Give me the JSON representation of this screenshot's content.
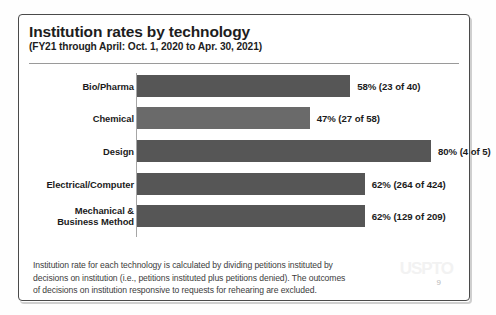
{
  "slide": {
    "title": "Institution rates by technology",
    "subtitle": "(FY21 through April: Oct. 1, 2020 to Apr. 30, 2021)",
    "page_number": "9",
    "watermark": "USPTO"
  },
  "footnote": {
    "line1": "Institution rate for each technology is calculated by dividing petitions instituted by",
    "line2": "decisions on institution (i.e., petitions instituted plus petitions denied). The outcomes",
    "line3": "of decisions on institution responsive to requests for rehearing are excluded."
  },
  "colors": {
    "bar_dark": "#565656",
    "bar_light": "#6a6a6a",
    "text": "#1b1b1b",
    "frame": "#4a4a4a"
  },
  "chart_data": {
    "type": "bar",
    "orientation": "horizontal",
    "title": "Institution rates by technology",
    "subtitle": "(FY21 through April: Oct. 1, 2020 to Apr. 30, 2021)",
    "xlabel": "",
    "ylabel": "",
    "xlim": [
      0,
      80
    ],
    "grid": false,
    "legend": "none",
    "categories": [
      "Bio/Pharma",
      "Chemical",
      "Design",
      "Electrical/Computer",
      "Mechanical & Business Method"
    ],
    "values": [
      58,
      47,
      80,
      62,
      62
    ],
    "labels": [
      "58% (23 of 40)",
      "47% (27 of 58)",
      "80% (4 of 5)",
      "62% (264 of 424)",
      "62% (129 of 209)"
    ],
    "points": [
      {
        "category": "Bio/Pharma",
        "category_line1": "Bio/Pharma",
        "category_line2": "",
        "percent": 58,
        "instituted": 23,
        "decisions": 40,
        "label": "58% (23 of 40)"
      },
      {
        "category": "Chemical",
        "category_line1": "Chemical",
        "category_line2": "",
        "percent": 47,
        "instituted": 27,
        "decisions": 58,
        "label": "47% (27 of 58)"
      },
      {
        "category": "Design",
        "category_line1": "Design",
        "category_line2": "",
        "percent": 80,
        "instituted": 4,
        "decisions": 5,
        "label": "80% (4 of 5)"
      },
      {
        "category": "Electrical/Computer",
        "category_line1": "Electrical/Computer",
        "category_line2": "",
        "percent": 62,
        "instituted": 264,
        "decisions": 424,
        "label": "62% (264 of 424)"
      },
      {
        "category": "Mechanical & Business Method",
        "category_line1": "Mechanical &",
        "category_line2": "Business Method",
        "percent": 62,
        "instituted": 129,
        "decisions": 209,
        "label": "62% (129 of 209)"
      }
    ]
  }
}
